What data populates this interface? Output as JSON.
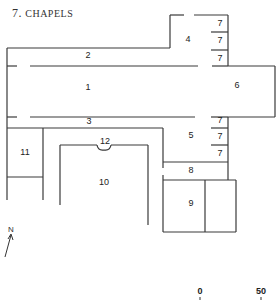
{
  "title": {
    "number": "7.",
    "text": "CHAPELS"
  },
  "rooms": [
    {
      "id": "room-1",
      "label": "1"
    },
    {
      "id": "room-2",
      "label": "2"
    },
    {
      "id": "room-3",
      "label": "3"
    },
    {
      "id": "room-4",
      "label": "4"
    },
    {
      "id": "room-5",
      "label": "5"
    },
    {
      "id": "room-6",
      "label": "6"
    },
    {
      "id": "room-7a",
      "label": "7"
    },
    {
      "id": "room-7b",
      "label": "7"
    },
    {
      "id": "room-7c",
      "label": "7"
    },
    {
      "id": "room-7d",
      "label": "7"
    },
    {
      "id": "room-7e",
      "label": "7"
    },
    {
      "id": "room-7f",
      "label": "7"
    },
    {
      "id": "room-8",
      "label": "8"
    },
    {
      "id": "room-9",
      "label": "9"
    },
    {
      "id": "room-10",
      "label": "10"
    },
    {
      "id": "room-11",
      "label": "11"
    },
    {
      "id": "room-12",
      "label": "12"
    }
  ],
  "north_arrow": {
    "label": "N"
  },
  "scale": {
    "start_label": "0",
    "end_label": "50"
  },
  "colors": {
    "line": "#3a3a3a",
    "text": "#222222",
    "background": "#ffffff"
  }
}
